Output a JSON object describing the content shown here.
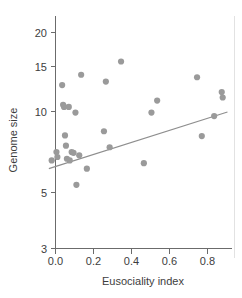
{
  "chart_data": {
    "type": "scatter",
    "title": "",
    "xlabel": "Eusociality index",
    "ylabel": "Genome size",
    "xlim": [
      -0.035,
      0.92
    ],
    "ylim": [
      3,
      21.5
    ],
    "yscale": "log",
    "xscale": "linear",
    "grid": false,
    "legend": null,
    "xticks": [
      0.0,
      0.2,
      0.4,
      0.6,
      0.8
    ],
    "xtick_labels": [
      "0.0",
      "0.2",
      "0.4",
      "0.6",
      "0.8"
    ],
    "yticks": [
      3,
      5,
      10,
      15,
      20
    ],
    "ytick_labels": [
      "3",
      "5",
      "10",
      "15",
      "20"
    ],
    "marker": {
      "shape": "circle",
      "color": "#9a9a9a",
      "radius_px": 3.1
    },
    "points": [
      {
        "x": -0.02,
        "y": 6.5
      },
      {
        "x": 0.005,
        "y": 7.0
      },
      {
        "x": 0.01,
        "y": 6.7
      },
      {
        "x": 0.035,
        "y": 12.6
      },
      {
        "x": 0.04,
        "y": 10.6
      },
      {
        "x": 0.045,
        "y": 10.4
      },
      {
        "x": 0.05,
        "y": 8.1
      },
      {
        "x": 0.055,
        "y": 7.4
      },
      {
        "x": 0.06,
        "y": 6.6
      },
      {
        "x": 0.07,
        "y": 10.4
      },
      {
        "x": 0.075,
        "y": 6.5
      },
      {
        "x": 0.085,
        "y": 7.0
      },
      {
        "x": 0.095,
        "y": 6.95
      },
      {
        "x": 0.105,
        "y": 9.9
      },
      {
        "x": 0.11,
        "y": 5.25
      },
      {
        "x": 0.125,
        "y": 6.8
      },
      {
        "x": 0.135,
        "y": 13.8
      },
      {
        "x": 0.165,
        "y": 6.05
      },
      {
        "x": 0.255,
        "y": 8.4
      },
      {
        "x": 0.265,
        "y": 13.0
      },
      {
        "x": 0.285,
        "y": 7.3
      },
      {
        "x": 0.345,
        "y": 15.5
      },
      {
        "x": 0.465,
        "y": 6.35
      },
      {
        "x": 0.505,
        "y": 9.9
      },
      {
        "x": 0.535,
        "y": 11.0
      },
      {
        "x": 0.745,
        "y": 13.5
      },
      {
        "x": 0.77,
        "y": 8.05
      },
      {
        "x": 0.835,
        "y": 9.6
      },
      {
        "x": 0.875,
        "y": 11.85
      },
      {
        "x": 0.88,
        "y": 11.3
      }
    ],
    "trendline": {
      "type": "linear-fit",
      "color": "#8e8e8e",
      "x_start": -0.035,
      "y_start": 6.05,
      "x_end": 0.905,
      "y_end": 9.95
    },
    "annotations": []
  }
}
